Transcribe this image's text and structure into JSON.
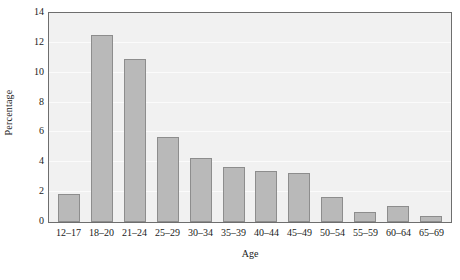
{
  "chart_data": {
    "type": "bar",
    "title": "",
    "xlabel": "Age",
    "ylabel": "Percentage",
    "categories": [
      "12–17",
      "18–20",
      "21–24",
      "25–29",
      "30–34",
      "35–39",
      "40–44",
      "45–49",
      "50–54",
      "55–59",
      "60–64",
      "65–69"
    ],
    "values": [
      1.9,
      12.55,
      10.9,
      5.7,
      4.3,
      3.7,
      3.45,
      3.25,
      1.7,
      0.65,
      1.1,
      0.4
    ],
    "ylim": [
      0,
      14
    ],
    "yticks": [
      0,
      2,
      4,
      6,
      8,
      10,
      12,
      14
    ],
    "ytick_labels": [
      "0",
      "2",
      "4",
      "6",
      "8",
      "10",
      "12",
      "14"
    ],
    "grid": true,
    "grid_axis": "y",
    "legend": false,
    "colors": {
      "bar_fill": "#b9b9b9",
      "bar_border": "#8d8d8d",
      "plot_background": "#f1f1f1",
      "gridline": "#fbfbfb",
      "axis_border": "#6e6e6e",
      "text": "#1a1a1a",
      "page_background": "#ffffff"
    }
  }
}
